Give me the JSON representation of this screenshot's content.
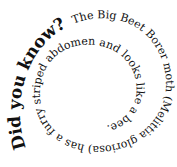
{
  "spiral": {
    "headline": "Did you know?",
    "sentence": "The Big Beet Borer moth (Melittia gloriosa) has a furry striped abdomen and looks like a bee.",
    "full_text": "Did you know? The Big Beet Borer moth (Melittia gloriosa) has a furry striped abdomen and looks like a bee.",
    "text_color": "#111111",
    "background": "#ffffff"
  }
}
